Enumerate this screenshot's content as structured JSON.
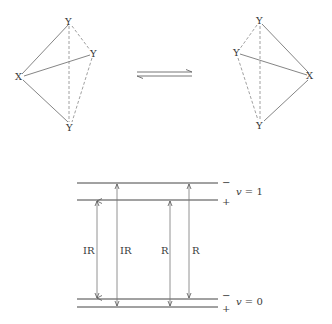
{
  "header": {
    "text": "MOLECULAR SYMMETRY"
  },
  "molecules": {
    "left": {
      "atoms": [
        {
          "label": "Y",
          "x": 69,
          "y": 22
        },
        {
          "label": "Y",
          "x": 93,
          "y": 54
        },
        {
          "label": "X",
          "x": 20,
          "y": 77
        },
        {
          "label": "Y",
          "x": 70,
          "y": 128
        }
      ]
    },
    "right": {
      "atoms": [
        {
          "label": "Y",
          "x": 260,
          "y": 21
        },
        {
          "label": "Y",
          "x": 237,
          "y": 53
        },
        {
          "label": "X",
          "x": 311,
          "y": 76
        },
        {
          "label": "Y",
          "x": 260,
          "y": 126
        }
      ]
    }
  },
  "equilibrium": {
    "symbol": "equilibrium-arrows"
  },
  "energy_levels": {
    "upper": {
      "label": "v = 1",
      "v": "v",
      "eq": "= 1",
      "sign_top": "−",
      "sign_bottom": "+"
    },
    "lower": {
      "label": "v = 0",
      "v": "v",
      "eq": "= 0",
      "sign_top": "−",
      "sign_bottom": "+"
    }
  },
  "transitions": [
    {
      "label": "IR",
      "x": 97,
      "from": "lower-minus",
      "to": "upper-plus"
    },
    {
      "label": "IR",
      "x": 117,
      "from": "lower-plus",
      "to": "upper-minus"
    },
    {
      "label": "R",
      "x": 170,
      "from": "lower-plus",
      "to": "upper-plus"
    },
    {
      "label": "R",
      "x": 189,
      "from": "lower-minus",
      "to": "upper-minus"
    }
  ]
}
